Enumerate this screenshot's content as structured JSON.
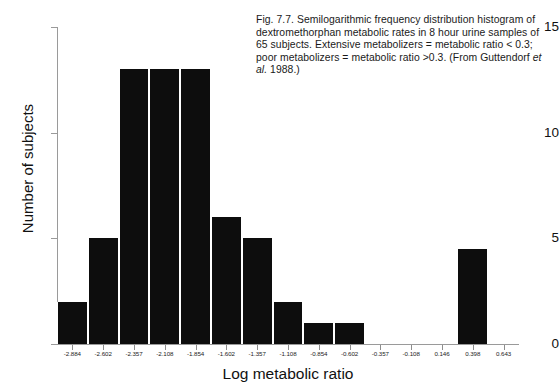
{
  "caption": {
    "text_before_italic": "Fig. 7.7. Semilogarithmic frequency distribution histogram of dextromethorphan metabolic rates in 8 hour urine samples of 65 subjects. Extensive metabolizers = metabolic ratio < 0.3; poor metabolizers = metabolic ratio >0.3. (From Guttendorf ",
    "italic_part": "et al.",
    "text_after_italic": " 1988.)"
  },
  "chart_data": {
    "type": "bar",
    "title": "",
    "xlabel": "Log metabolic ratio",
    "ylabel": "Number of subjects",
    "ylim": [
      0,
      15
    ],
    "yticks": [
      0,
      5,
      10,
      15
    ],
    "ytick_labels": [
      "0",
      "5",
      "10",
      "15"
    ],
    "grid": false,
    "legend": "none",
    "categories": [
      "-2.884",
      "-2.602",
      "-2.357",
      "-2.108",
      "-1.854",
      "-1.602",
      "-1.357",
      "-1.108",
      "-0.854",
      "-0.602",
      "-0.357",
      "-0.108",
      "0.146",
      "0.398",
      "0.643"
    ],
    "xtick_labels": [
      "-2.884",
      "-2.602",
      "-2.357",
      "-2.108",
      "-1.854",
      "-1.602",
      "-1.357",
      "-1.108",
      "-0.854",
      "-0.602",
      "-0.357",
      "-0.108",
      "0.146",
      "0.398",
      "0.643"
    ],
    "values": [
      2,
      5,
      13,
      13,
      13,
      6,
      5,
      2,
      1,
      1,
      0,
      0,
      0,
      4.5,
      0
    ],
    "bar_color": "#0d0d0d",
    "axis_color": "#9a9a9a",
    "n_bins": 15
  }
}
